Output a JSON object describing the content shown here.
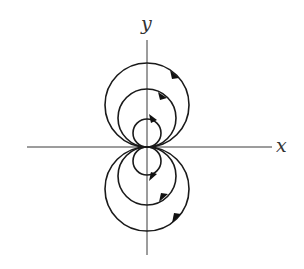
{
  "diagram": {
    "title": "",
    "origin": {
      "x": 147,
      "y": 147
    },
    "axes": {
      "x": {
        "label": "x",
        "from": 27,
        "to": 272,
        "y": 147
      },
      "y": {
        "label": "y",
        "from": 40,
        "to": 255,
        "x": 147
      }
    },
    "labels": {
      "x_axis": "x",
      "y_axis": "y"
    },
    "colors": {
      "line": "#1a1a1a",
      "axis": "#3a3a3a",
      "background": "#ffffff"
    },
    "upper_circles": [
      {
        "id": "upper-small",
        "cx": 147,
        "cy": 133,
        "r": 14,
        "direction": "clockwise"
      },
      {
        "id": "upper-medium",
        "cx": 147,
        "cy": 118,
        "r": 29,
        "direction": "clockwise"
      },
      {
        "id": "upper-large",
        "cx": 147,
        "cy": 105,
        "r": 42,
        "direction": "clockwise"
      }
    ],
    "lower_circles": [
      {
        "id": "lower-small",
        "cx": 147,
        "cy": 161,
        "r": 14,
        "direction": "counterclockwise"
      },
      {
        "id": "lower-medium",
        "cx": 147,
        "cy": 176,
        "r": 29,
        "direction": "counterclockwise"
      },
      {
        "id": "lower-large",
        "cx": 147,
        "cy": 189,
        "r": 42,
        "direction": "counterclockwise"
      }
    ]
  }
}
